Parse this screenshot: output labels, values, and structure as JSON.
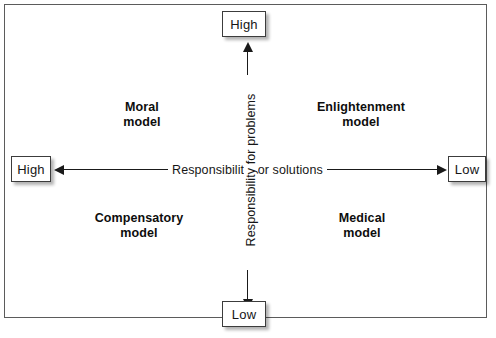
{
  "diagram": {
    "type": "two-by-two-matrix",
    "border_color": "#5b5b5b",
    "line_color": "#1a1a1a",
    "background": "#ffffff",
    "axes": {
      "horizontal": {
        "label": "Responsibility for solutions",
        "left_end": "High",
        "right_end": "Low"
      },
      "vertical": {
        "label": "Responsibility for problems",
        "top_end": "High",
        "bottom_end": "Low"
      }
    },
    "quadrants": [
      {
        "position": "top-left",
        "line1": "Moral",
        "line2": "model"
      },
      {
        "position": "top-right",
        "line1": "Enlightenment",
        "line2": "model"
      },
      {
        "position": "bottom-left",
        "line1": "Compensatory",
        "line2": "model"
      },
      {
        "position": "bottom-right",
        "line1": "Medical",
        "line2": "model"
      }
    ]
  }
}
